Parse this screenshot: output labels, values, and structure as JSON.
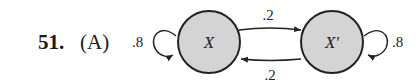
{
  "question": {
    "number": "51.",
    "choice": "(A)"
  },
  "diagram": {
    "nodes": [
      {
        "id": "X",
        "label": "X"
      },
      {
        "id": "Xp",
        "label": "X′"
      }
    ],
    "edges": [
      {
        "from": "X",
        "to": "X",
        "label": ".8"
      },
      {
        "from": "X",
        "to": "Xp",
        "label": ".2"
      },
      {
        "from": "Xp",
        "to": "X",
        "label": ".2"
      },
      {
        "from": "Xp",
        "to": "Xp",
        "label": ".8"
      }
    ],
    "node_fill": "#d4d4d4",
    "stroke": "#222222"
  }
}
